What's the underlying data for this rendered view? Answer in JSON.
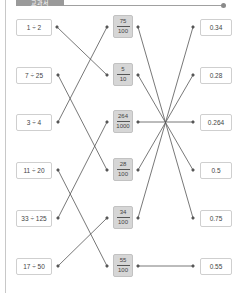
{
  "header": {
    "tab_label": "교과서"
  },
  "colors": {
    "line": "#555555",
    "mid_box_bg": "#d6d6d6",
    "box_border": "#cfcfcf"
  },
  "left_items": [
    {
      "label": "1 ÷ 2",
      "y": 27
    },
    {
      "label": "7 ÷ 25",
      "y": 75
    },
    {
      "label": "3 ÷ 4",
      "y": 122
    },
    {
      "label": "11 ÷ 20",
      "y": 170
    },
    {
      "label": "33 ÷ 125",
      "y": 218
    },
    {
      "label": "17 ÷ 50",
      "y": 266
    }
  ],
  "middle_items": [
    {
      "numerator": "75",
      "denominator": "100",
      "y": 27
    },
    {
      "numerator": "5",
      "denominator": "10",
      "y": 75
    },
    {
      "numerator": "264",
      "denominator": "1000",
      "y": 122
    },
    {
      "numerator": "28",
      "denominator": "100",
      "y": 170
    },
    {
      "numerator": "34",
      "denominator": "100",
      "y": 218
    },
    {
      "numerator": "55",
      "denominator": "100",
      "y": 266
    }
  ],
  "right_items": [
    {
      "label": "0.34",
      "y": 27
    },
    {
      "label": "0.28",
      "y": 75
    },
    {
      "label": "0.264",
      "y": 122
    },
    {
      "label": "0.5",
      "y": 170
    },
    {
      "label": "0.75",
      "y": 218
    },
    {
      "label": "0.55",
      "y": 266
    }
  ],
  "connections_left_to_middle": [
    {
      "from": "1 ÷ 2",
      "to": "5/10"
    },
    {
      "from": "7 ÷ 25",
      "to": "28/100"
    },
    {
      "from": "3 ÷ 4",
      "to": "75/100"
    },
    {
      "from": "11 ÷ 20",
      "to": "55/100"
    },
    {
      "from": "33 ÷ 125",
      "to": "264/1000"
    },
    {
      "from": "17 ÷ 50",
      "to": "34/100"
    }
  ],
  "connections_middle_to_right": [
    {
      "from": "75/100",
      "to": "0.75"
    },
    {
      "from": "5/10",
      "to": "0.5"
    },
    {
      "from": "264/1000",
      "to": "0.264"
    },
    {
      "from": "28/100",
      "to": "0.28"
    },
    {
      "from": "34/100",
      "to": "0.34"
    },
    {
      "from": "55/100",
      "to": "0.55"
    }
  ]
}
